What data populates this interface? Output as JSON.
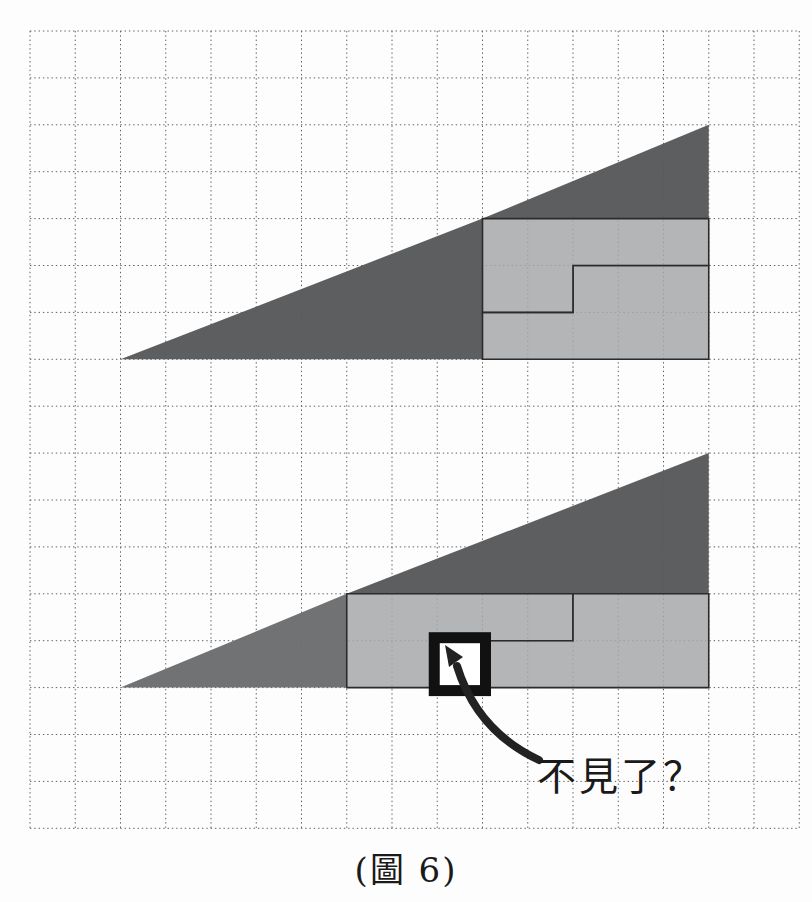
{
  "caption": {
    "text": "(圖 6)"
  },
  "annotation": {
    "text": "不見了？"
  },
  "colors": {
    "background": "#fdfdfd",
    "dark": "#58595b",
    "medium": "#6b6d6f",
    "light": "#a6a8aa",
    "piece_line": "#2b2b2b",
    "grid_line": "#5f5f5f",
    "marker": "#111111",
    "arrow": "#222222",
    "text": "#1a1a1a"
  },
  "grid": {
    "origin_x": 30,
    "origin_y": 31,
    "cell_w": 45.25,
    "cell_h": 46.9,
    "cols": 17,
    "rows": 17
  },
  "figures": [
    {
      "name": "top-arrangement",
      "origin_col": 2,
      "base_row": 7,
      "width_cells": 13,
      "height_cells": 5,
      "pieces": [
        {
          "name": "dark-triangle-8x3",
          "color": "dark",
          "outlined": false,
          "points": [
            [
              0,
              0
            ],
            [
              8,
              0
            ],
            [
              8,
              3
            ]
          ]
        },
        {
          "name": "dark-triangle-5x2",
          "color": "dark",
          "outlined": false,
          "points": [
            [
              8,
              3
            ],
            [
              13,
              3
            ],
            [
              13,
              5
            ]
          ]
        },
        {
          "name": "light-l-piece-8",
          "color": "light",
          "outlined": true,
          "points": [
            [
              8,
              0
            ],
            [
              13,
              0
            ],
            [
              13,
              2
            ],
            [
              10,
              2
            ],
            [
              10,
              1
            ],
            [
              8,
              1
            ]
          ]
        },
        {
          "name": "light-l-piece-7",
          "color": "light",
          "outlined": true,
          "points": [
            [
              8,
              1
            ],
            [
              10,
              1
            ],
            [
              10,
              2
            ],
            [
              13,
              2
            ],
            [
              13,
              3
            ],
            [
              8,
              3
            ]
          ]
        }
      ]
    },
    {
      "name": "bottom-arrangement",
      "origin_col": 2,
      "base_row": 14,
      "width_cells": 13,
      "height_cells": 5,
      "pieces": [
        {
          "name": "medium-triangle-5x2",
          "color": "medium",
          "outlined": false,
          "points": [
            [
              0,
              0
            ],
            [
              5,
              0
            ],
            [
              5,
              2
            ]
          ]
        },
        {
          "name": "dark-triangle-8x3",
          "color": "dark",
          "outlined": false,
          "points": [
            [
              5,
              2
            ],
            [
              13,
              2
            ],
            [
              13,
              5
            ]
          ]
        },
        {
          "name": "light-l-piece-7",
          "color": "light",
          "outlined": true,
          "points": [
            [
              5,
              0
            ],
            [
              7,
              0
            ],
            [
              7,
              1
            ],
            [
              10,
              1
            ],
            [
              10,
              2
            ],
            [
              5,
              2
            ]
          ]
        },
        {
          "name": "light-l-piece-8",
          "color": "light",
          "outlined": true,
          "points": [
            [
              8,
              0
            ],
            [
              13,
              0
            ],
            [
              13,
              2
            ],
            [
              10,
              2
            ],
            [
              10,
              1
            ],
            [
              8,
              1
            ]
          ]
        }
      ]
    }
  ],
  "missing_square_marker": {
    "figure_index": 1,
    "cell_x": 7,
    "cell_y": 0,
    "border_width": 11,
    "fill": "#ffffff"
  },
  "arrow": {
    "tail_path": "M 539 760 Q 477 731 457 666",
    "head_points": "445,645 463,657 449,667",
    "stroke_width": 8
  }
}
